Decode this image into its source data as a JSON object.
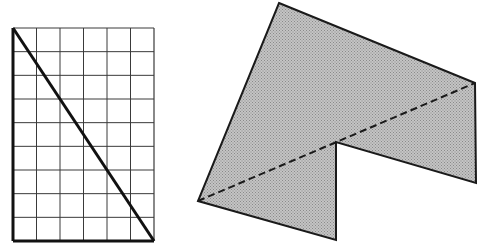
{
  "figure": {
    "width": 485,
    "height": 252,
    "background": "#ffffff",
    "grid_rectangle": {
      "columns": 6,
      "rows": 9,
      "x0": 13,
      "y0": 28,
      "x1": 154,
      "y1": 241,
      "grid_line_color": "#3a3a3a",
      "border_color": "#111111",
      "diagonal": {
        "from": "top-left",
        "to": "bottom-right"
      }
    },
    "polygon": {
      "fill": "#b9b9b9",
      "stroke": "#1a1a1a",
      "vertices": [
        [
          279,
          3
        ],
        [
          475,
          83
        ],
        [
          476,
          183
        ],
        [
          336,
          142
        ],
        [
          336,
          240
        ],
        [
          198,
          201
        ]
      ],
      "dashed_diagonal": {
        "from": [
          198,
          201
        ],
        "to": [
          475,
          83
        ]
      }
    }
  }
}
